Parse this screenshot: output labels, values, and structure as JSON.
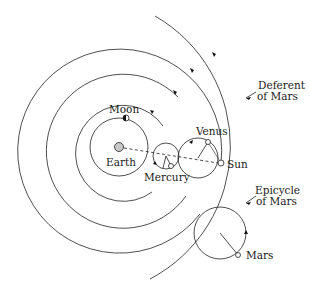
{
  "diagram": {
    "labels": {
      "moon": "Moon",
      "earth": "Earth",
      "mercury": "Mercury",
      "venus": "Venus",
      "sun": "Sun",
      "mars": "Mars",
      "deferent_line1": "Deferent",
      "deferent_line2": "of Mars",
      "epicycle_line1": "Epicycle",
      "epicycle_line2": "of Mars"
    },
    "bodies": [
      "Earth",
      "Moon",
      "Mercury",
      "Venus",
      "Sun",
      "Mars"
    ],
    "colors": {
      "line": "#222222",
      "earth_fill": "#c8c8c8",
      "background": "#ffffff"
    }
  }
}
